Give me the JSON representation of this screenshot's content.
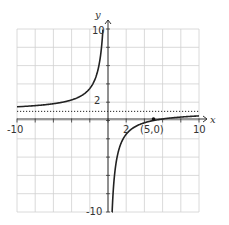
{
  "chart_data": {
    "type": "line",
    "title": "",
    "xlabel": "x",
    "ylabel": "y",
    "xlim": [
      -10,
      10
    ],
    "ylim": [
      -10,
      10
    ],
    "grid": true,
    "grid_step": 2,
    "tick_labels": {
      "x": [
        {
          "value": -10,
          "label": "-10"
        },
        {
          "value": 2,
          "label": "2"
        },
        {
          "value": 10,
          "label": "10"
        }
      ],
      "y": [
        {
          "value": 10,
          "label": "10"
        },
        {
          "value": 2,
          "label": "2"
        },
        {
          "value": -10,
          "label": "-10"
        }
      ]
    },
    "series": [
      {
        "name": "f(x) = 1 - 5/x",
        "style": "solid",
        "color": "#222222",
        "branches": [
          {
            "x": [
              -10,
              -8,
              -6,
              -4,
              -3,
              -2,
              -1.5,
              -1,
              -0.75,
              -0.56
            ],
            "y": [
              1.5,
              1.63,
              1.83,
              2.25,
              2.67,
              3.5,
              4.33,
              6,
              7.67,
              10
            ]
          },
          {
            "x": [
              0.45,
              0.6,
              0.8,
              1,
              1.5,
              2,
              3,
              4,
              5,
              6,
              8,
              10
            ],
            "y": [
              -10,
              -7.33,
              -5.25,
              -4,
              -2.33,
              -1.5,
              -0.67,
              -0.25,
              0,
              0.17,
              0.38,
              0.5
            ]
          }
        ]
      },
      {
        "name": "horizontal asymptote y = 1",
        "style": "dotted",
        "color": "#222222",
        "x": [
          -10,
          10
        ],
        "y": [
          1,
          1
        ]
      }
    ],
    "annotations": [
      {
        "type": "point",
        "x": 5,
        "y": 0,
        "label": "(5,0)"
      }
    ]
  },
  "labels": {
    "x_axis": "x",
    "y_axis": "y",
    "x_min": "-10",
    "x_max": "10",
    "x_two": "2",
    "y_max": "10",
    "y_min": "-10",
    "y_two": "2",
    "point": "(5,0)"
  },
  "colors": {
    "grid": "#d0d0d0",
    "axis": "#333333",
    "curve": "#222222"
  }
}
